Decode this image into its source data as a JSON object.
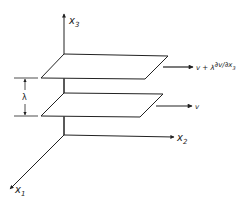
{
  "diagram": {
    "type": "shear-flow-planes",
    "axes": {
      "x1": {
        "label": "x",
        "subscript": "1"
      },
      "x2": {
        "label": "x",
        "subscript": "2"
      },
      "x3": {
        "label": "x",
        "subscript": "3"
      }
    },
    "planes": [
      {
        "name": "upper-plane",
        "velocity_label_prefix": "v + λ",
        "velocity_derivative": "∂v/∂x",
        "velocity_derivative_subscript": "3"
      },
      {
        "name": "lower-plane",
        "velocity_label": "v"
      }
    ],
    "separation_label": "λ",
    "colors": {
      "stroke": "#222222",
      "background": "#ffffff"
    }
  }
}
